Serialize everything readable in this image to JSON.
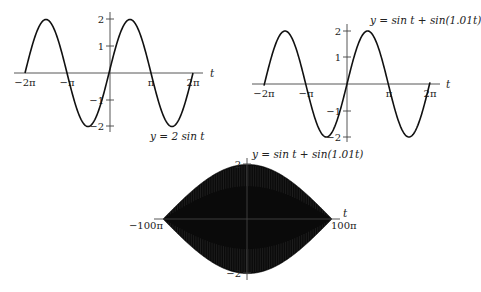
{
  "chart_data": [
    {
      "type": "line",
      "title": "y = 2 sin t",
      "equation_label": "y = 2 sin t",
      "xlabel": "t",
      "ylabel": "",
      "function": "2*sin(t)",
      "xlim": [
        -6.2832,
        6.2832
      ],
      "ylim": [
        -2,
        2
      ],
      "x_ticks": [
        "−2π",
        "−π",
        "π",
        "2π"
      ],
      "x_tick_values": [
        -6.2832,
        -3.1416,
        3.1416,
        6.2832
      ],
      "y_ticks": [
        "2",
        "1",
        "−1",
        "−2"
      ],
      "y_tick_values": [
        2,
        1,
        -1,
        -2
      ],
      "grid": false,
      "sample_points": {
        "x": [
          -6.2832,
          -4.7124,
          -3.1416,
          -1.5708,
          0,
          1.5708,
          3.1416,
          4.7124,
          6.2832
        ],
        "y": [
          0,
          2,
          0,
          -2,
          0,
          2,
          0,
          -2,
          0
        ]
      }
    },
    {
      "type": "line",
      "title": "y = sin t + sin(1.01t)",
      "equation_label": "y = sin t + sin(1.01t)",
      "xlabel": "t",
      "ylabel": "",
      "function": "sin(t)+sin(1.01*t)",
      "xlim": [
        -6.2832,
        6.2832
      ],
      "ylim": [
        -2,
        2
      ],
      "x_ticks": [
        "−2π",
        "−π",
        "π",
        "2π"
      ],
      "x_tick_values": [
        -6.2832,
        -3.1416,
        3.1416,
        6.2832
      ],
      "y_ticks": [
        "2",
        "1",
        "−1",
        "−2"
      ],
      "y_tick_values": [
        2,
        1,
        -1,
        -2
      ],
      "grid": false,
      "sample_points": {
        "x": [
          -6.2832,
          -4.7124,
          -3.1416,
          -1.5708,
          0,
          1.5708,
          3.1416,
          4.7124,
          6.2832
        ],
        "y": [
          0.06,
          2.0,
          0.03,
          -2.0,
          0,
          2.0,
          -0.03,
          -2.0,
          -0.06
        ]
      }
    },
    {
      "type": "line",
      "title": "y = sin t + sin(1.01t)",
      "equation_label": "y = sin t + sin(1.01t)",
      "xlabel": "t",
      "ylabel": "",
      "function": "sin(t)+sin(1.01*t)",
      "xlim": [
        -314.16,
        314.16
      ],
      "ylim": [
        -2,
        2
      ],
      "x_ticks": [
        "−100π",
        "100π"
      ],
      "x_tick_values": [
        -314.16,
        314.16
      ],
      "y_ticks": [
        "2",
        "−2"
      ],
      "y_tick_values": [
        2,
        -2
      ],
      "grid": false,
      "envelope": "2|cos(0.005t)|",
      "sample_points": {
        "x": [
          -314.16,
          -157.08,
          0,
          157.08,
          314.16
        ],
        "envelope_y": [
          0,
          1.41,
          2,
          1.41,
          0
        ]
      }
    }
  ]
}
